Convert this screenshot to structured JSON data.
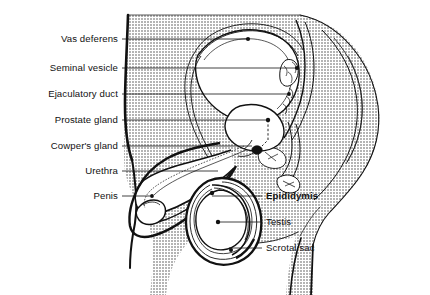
{
  "figure": {
    "name": "male-reproductive-system-sagittal-diagram",
    "width": 430,
    "height": 295,
    "background_color": "#ffffff",
    "ink_color": "#111111",
    "shade_color": "#c9c9c9",
    "organ_fill_color": "#ffffff"
  },
  "labels_left": [
    {
      "text": "Vas deferens",
      "x": 118,
      "y": 39,
      "line_to_x": 248,
      "dot": false,
      "bold": false
    },
    {
      "text": "Seminal vesicle",
      "x": 118,
      "y": 68,
      "line_to_x": 297,
      "dot": true,
      "bold": false
    },
    {
      "text": "Ejaculatory duct",
      "x": 118,
      "y": 94,
      "line_to_x": 289,
      "dot": true,
      "bold": false
    },
    {
      "text": "Prostate glande",
      "x": 118,
      "y": 120,
      "line_to_x": 268,
      "dot": true,
      "bold": false
    },
    {
      "text": "Cowper's gland",
      "x": 118,
      "y": 146,
      "line_to_x": 268,
      "dot": true,
      "bold": false
    },
    {
      "text": "Urethra",
      "x": 118,
      "y": 171,
      "line_to_x": 218,
      "dot": false,
      "bold": false
    },
    {
      "text": "Penis",
      "x": 118,
      "y": 196,
      "line_to_x": 152,
      "dot": true,
      "bold": false
    }
  ],
  "labels_left_text": [
    "Vas deferens",
    "Seminal vesicle",
    "Ejaculatory duct",
    "Prostate gland",
    "Cowper's gland",
    "Urethra",
    "Penis"
  ],
  "labels_right": [
    {
      "text": "Epididymis",
      "x": 265,
      "y": 196,
      "line_from_x": 212,
      "dot": true,
      "bold": true
    },
    {
      "text": "Testis",
      "x": 265,
      "y": 222,
      "line_from_x": 218,
      "dot": true,
      "bold": false
    },
    {
      "text": "Scrotal sac",
      "x": 265,
      "y": 248,
      "line_from_x": 229,
      "dot": true,
      "bold": false
    }
  ],
  "leader_lines": {
    "color": "#111111",
    "width": 0.8,
    "dot_radius": 2.2
  }
}
